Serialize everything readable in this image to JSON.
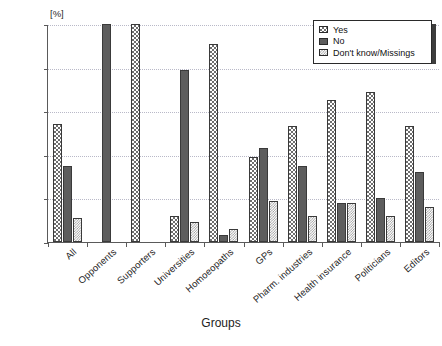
{
  "chart_data": {
    "type": "bar",
    "title": "",
    "xlabel": "Groups",
    "ylabel": "",
    "unit_label": "[%]",
    "ylim": [
      0,
      100
    ],
    "yticks": [
      0,
      20,
      40,
      60,
      80,
      100
    ],
    "grid": true,
    "legend_position": "top-right",
    "categories": [
      "All",
      "Opponents",
      "Supporters",
      "Universities",
      "Homoeopaths",
      "GPs",
      "Pharm. industries",
      "Health insurance",
      "Politicians",
      "Editors"
    ],
    "series": [
      {
        "name": "Yes",
        "values": [
          54,
          0,
          100,
          12,
          91,
          39,
          53,
          65,
          69,
          53
        ]
      },
      {
        "name": "No",
        "values": [
          35,
          100,
          0,
          79,
          3,
          43,
          35,
          18,
          20,
          32
        ]
      },
      {
        "name": "Don't know/Missings",
        "values": [
          11,
          0,
          0,
          9,
          6,
          19,
          12,
          18,
          12,
          16
        ]
      }
    ]
  },
  "legend": {
    "items": [
      {
        "label": "Yes"
      },
      {
        "label": "No"
      },
      {
        "label": "Don't know/Missings"
      }
    ]
  }
}
